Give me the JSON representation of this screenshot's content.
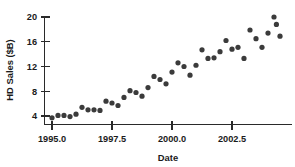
{
  "chart_data": {
    "type": "scatter",
    "title": "",
    "xlabel": "Date",
    "ylabel": "HD Sales ($B)",
    "xlim": [
      1994.7,
      2004.6
    ],
    "ylim": [
      3.0,
      21.0
    ],
    "grid": false,
    "legend": null,
    "marker": "filled-circle",
    "marker_color": "#3b3b3b",
    "xticks": [
      1995.0,
      1997.5,
      2000.0,
      2002.5
    ],
    "xtick_labels": [
      "1995.0",
      "1997.5",
      "2000.0",
      "2002.5"
    ],
    "yticks": [
      4,
      8,
      12,
      16,
      20
    ],
    "ytick_labels": [
      "4",
      "8",
      "12",
      "16",
      "20"
    ],
    "x": [
      1995.0,
      1995.25,
      1995.5,
      1995.75,
      1996.0,
      1996.25,
      1996.5,
      1996.75,
      1997.0,
      1997.25,
      1997.5,
      1997.75,
      1998.0,
      1998.25,
      1998.5,
      1998.75,
      1999.0,
      1999.25,
      1999.5,
      1999.75,
      2000.0,
      2000.25,
      2000.5,
      2000.75,
      2001.0,
      2001.25,
      2001.5,
      2001.75,
      2002.0,
      2002.25,
      2002.5,
      2002.75,
      2003.0,
      2003.25,
      2003.5,
      2003.75,
      2004.0,
      2004.25
    ],
    "y": [
      3.7,
      4.1,
      4.1,
      3.9,
      4.3,
      5.4,
      5.0,
      5.0,
      4.9,
      6.4,
      6.1,
      5.7,
      7.0,
      8.1,
      7.8,
      7.2,
      8.6,
      10.4,
      9.9,
      9.2,
      11.1,
      12.6,
      12.0,
      10.6,
      12.2,
      14.7,
      13.3,
      13.4,
      14.4,
      16.2,
      14.8,
      15.1,
      13.3,
      17.9,
      16.5,
      15.1,
      17.4,
      20.0
    ],
    "series": [
      {
        "name": "HD Sales ($B)",
        "values": [
          3.7,
          4.1,
          4.1,
          3.9,
          4.3,
          5.4,
          5.0,
          5.0,
          4.9,
          6.4,
          6.1,
          5.7,
          7.0,
          8.1,
          7.8,
          7.2,
          8.6,
          10.4,
          9.9,
          9.2,
          11.1,
          12.6,
          12.0,
          10.6,
          12.2,
          14.7,
          13.3,
          13.4,
          14.4,
          16.2,
          14.8,
          15.1,
          13.3,
          17.9,
          16.5,
          15.1,
          17.4,
          20.0
        ]
      }
    ],
    "extra_points": [
      {
        "x": 2004.35,
        "y": 18.8
      },
      {
        "x": 2004.5,
        "y": 16.9
      }
    ]
  }
}
